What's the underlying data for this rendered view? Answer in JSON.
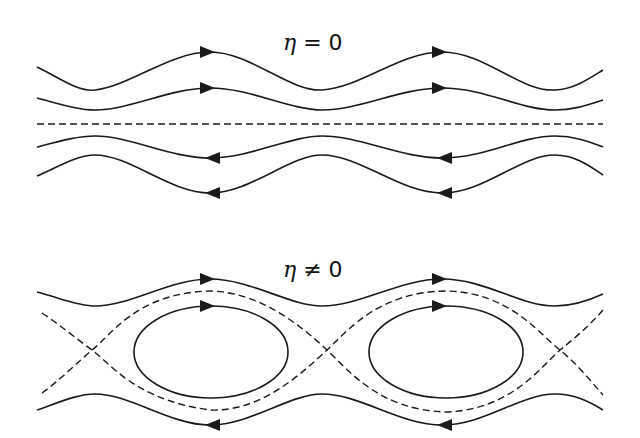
{
  "panels": [
    {
      "label": {
        "symbol": "η",
        "relation": " = ",
        "value": "0"
      },
      "description": "flow lines without islands; upper lines flow right, lower lines flow left, separated by dashed center line"
    },
    {
      "label": {
        "symbol": "η",
        "relation": " ≠ ",
        "value": "0"
      },
      "description": "magnetic islands: closed elliptical orbits bounded by dashed separatrix with X-points; outer lines flow right (top) and left (bottom)"
    }
  ],
  "colors": {
    "line": "#1a1a1a",
    "background": "#ffffff"
  },
  "icons": {
    "arrow": "arrowhead-icon",
    "x_point": "x-point-icon"
  }
}
